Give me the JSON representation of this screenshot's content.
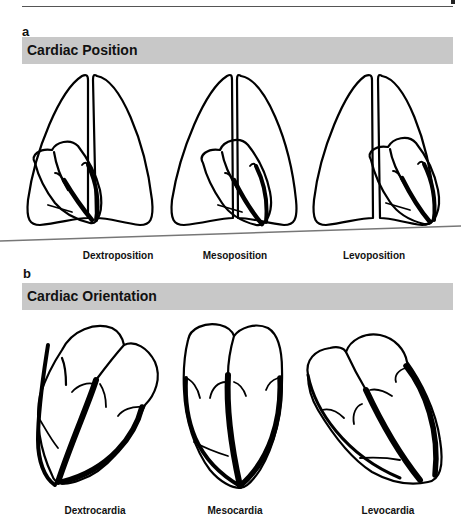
{
  "panel_a": {
    "letter": "a",
    "title": "Cardiac Position",
    "captions": [
      "Dextroposition",
      "Mesoposition",
      "Levoposition"
    ]
  },
  "panel_b": {
    "letter": "b",
    "title": "Cardiac Orientation",
    "captions": [
      "Dextrocardia",
      "Mesocardia",
      "Levocardia"
    ]
  },
  "colors": {
    "banner": "#c8c8c8",
    "stroke": "#000000",
    "rule": "#555555"
  }
}
